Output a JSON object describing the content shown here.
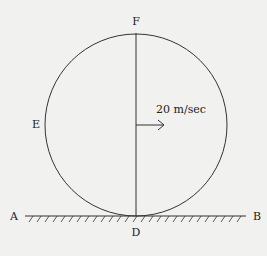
{
  "diagram": {
    "title": "",
    "labels": {
      "top": "F",
      "left": "E",
      "bottom": "D",
      "ground_left": "A",
      "ground_right": "B",
      "velocity": "20 m/sec"
    },
    "colors": {
      "stroke": "#333333",
      "background": "#f1f1ef",
      "text": "#222222"
    }
  }
}
